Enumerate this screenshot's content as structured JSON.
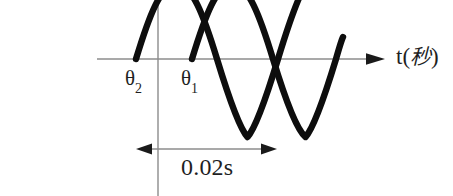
{
  "figure": {
    "background_color": "#ffffff",
    "width": 453,
    "height": 196
  },
  "axes": {
    "horizontal": {
      "label_symbol": "t",
      "label_open_paren": "(",
      "label_unit": "秒",
      "label_close_paren": ")",
      "label_full": "t(秒)",
      "color": "#8c8c8c",
      "y_pixel": 59,
      "x_start": 97,
      "x_arrow_tip": 385
    },
    "vertical": {
      "color": "#8c8c8c",
      "x_pixel": 158,
      "y_start": 0,
      "y_end": 196
    }
  },
  "annotations": {
    "phase_labels": [
      {
        "name": "theta2",
        "base": "θ",
        "subscript": "2",
        "text": "θ2"
      },
      {
        "name": "theta1",
        "base": "θ",
        "subscript": "1",
        "text": "θ1"
      }
    ],
    "dimension": {
      "value": "0.02s",
      "x_left": 136,
      "x_right": 277,
      "y_pixel": 149,
      "color": "#8c8c8c"
    }
  },
  "chart_data": {
    "type": "line",
    "title": "",
    "xlabel": "t(秒)",
    "ylabel": "",
    "xlim": [
      97,
      385
    ],
    "ylim": [
      -1.35,
      1.35
    ],
    "grid": false,
    "legend": "none",
    "period_seconds": 0.02,
    "period_pixels": 141,
    "amplitude_pixels": 78,
    "axis_y_pixel": 59,
    "stroke_color": "#0d0d0d",
    "stroke_width": 6.4,
    "series": [
      {
        "name": "θ2",
        "phase_label": "θ2",
        "zero_crossing_rising_x": 136,
        "trough_x": 247,
        "path": "M 136,59 C 150,13 160,-12 176.5,-19 C 193,-12 203,13 217,59 C 231,105 241,130 247.5,137 C 254,130 264,105 278,59 C 292,13 302,-12 308.5,-19",
        "visible_x_range": [
          136,
          310
        ]
      },
      {
        "name": "θ1",
        "phase_label": "θ1",
        "zero_crossing_rising_x": 192,
        "trough_x": 305,
        "path": "M 192,59 C 206,13 216,-12 232.5,-19 C 249,-12 259,13 273,59 C 287,105 297,130 305.5,137 C 312,130 322,105 336,59 C 340,45 342,39 343,37",
        "visible_x_range": [
          192,
          343
        ]
      }
    ],
    "crossings": [
      {
        "x": 203,
        "y": 38
      },
      {
        "x": 280,
        "y": 75
      }
    ],
    "annotations": [
      {
        "text": "θ2",
        "x": 127,
        "y": 88
      },
      {
        "text": "θ1",
        "x": 183,
        "y": 88
      },
      {
        "text": "0.02s",
        "x": 183,
        "y": 178
      },
      {
        "text": "t(秒)",
        "x": 396,
        "y": 62
      }
    ]
  }
}
